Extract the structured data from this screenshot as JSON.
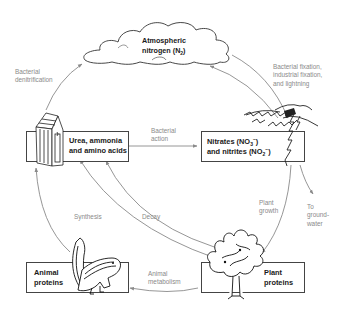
{
  "diagram": {
    "type": "nitrogen cycle",
    "nodes": {
      "atmosphere": {
        "line1": "Atmospheric",
        "line2_pre": "nitrogen (N",
        "line2_sub": "2",
        "line2_post": ")"
      },
      "urea": {
        "line1": "Urea, ammonia",
        "line2": "and amino acids"
      },
      "nitrates": {
        "line1_pre": "Nitrates (NO",
        "line1_sub": "3",
        "line1_sup": "−",
        "line1_post": ")",
        "line2_pre": "and nitrites (NO",
        "line2_sub": "2",
        "line2_sup": "−",
        "line2_post": ")"
      },
      "animal": {
        "line1": "Animal",
        "line2": "proteins"
      },
      "plant": {
        "line1": "Plant",
        "line2": "proteins"
      }
    },
    "edges": {
      "denitrification": {
        "line1": "Bacterial",
        "line2": "denitrification"
      },
      "fixation": {
        "line1": "Bacterial fixation,",
        "line2": "industrial fixation,",
        "line3": "and lightning"
      },
      "bacterial_action": {
        "line1": "Bacterial",
        "line2": "action"
      },
      "plant_growth": {
        "line1": "Plant",
        "line2": "growth"
      },
      "groundwater": {
        "line1": "To",
        "line2": "ground-",
        "line3": "water"
      },
      "synthesis": {
        "label": "Synthesis"
      },
      "decay": {
        "label": "Decay"
      },
      "animal_metabolism": {
        "line1": "Animal",
        "line2": "metabolism"
      }
    },
    "icons": [
      "cloud-icon",
      "outhouse-icon",
      "lightning-icon",
      "chipmunk-icon",
      "tree-icon"
    ],
    "colors": {
      "arrow": "#8a8a8a",
      "box_border": "#444444",
      "text": "#1a1a1a",
      "label": "#8a8a8a"
    }
  }
}
